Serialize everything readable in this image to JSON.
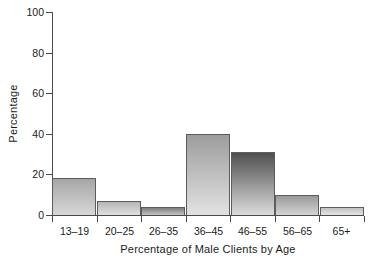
{
  "chart_data": {
    "type": "bar",
    "title": "",
    "xlabel": "Percentage of Male Clients by Age",
    "ylabel": "Percentage",
    "categories": [
      "13–19",
      "20–25",
      "26–35",
      "36–45",
      "46–55",
      "56–65",
      "65+"
    ],
    "values": [
      18,
      7,
      4,
      40,
      31,
      10,
      4
    ],
    "ylim": [
      0,
      100
    ],
    "yticks": [
      0,
      20,
      40,
      60,
      80,
      100
    ],
    "ytick_labels": [
      "0",
      "20",
      "40",
      "60",
      "80",
      "100"
    ],
    "grid": false,
    "legend": false,
    "orientation": "vertical",
    "bar_styles": [
      {
        "category": "13–19",
        "top_color": "#a6a6a6",
        "bottom_color": "#d8d8d8"
      },
      {
        "category": "20–25",
        "top_color": "#b5b5b5",
        "bottom_color": "#e0e0e0"
      },
      {
        "category": "26–35",
        "top_color": "#7e7e7e",
        "bottom_color": "#c4c4c4"
      },
      {
        "category": "36–45",
        "top_color": "#9d9d9d",
        "bottom_color": "#e2e2e2"
      },
      {
        "category": "46–55",
        "top_color": "#4f4f4f",
        "bottom_color": "#dcdcdc"
      },
      {
        "category": "56–65",
        "top_color": "#9a9a9a",
        "bottom_color": "#d4d4d4"
      },
      {
        "category": "65+",
        "top_color": "#c2c2c2",
        "bottom_color": "#e4e4e4"
      }
    ],
    "outline_color": "#5c5c5c",
    "axis_color": "#4a4a4a",
    "background_color": "#ffffff"
  }
}
